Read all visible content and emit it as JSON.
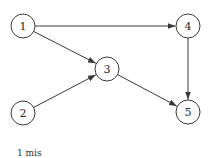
{
  "diagram": {
    "type": "directed-graph",
    "colors": {
      "stroke": "#3a3a3a",
      "text": "#2a2a2a",
      "background": "#ffffff"
    },
    "nodes": [
      {
        "id": "1",
        "label": "1",
        "x": 23,
        "y": 26
      },
      {
        "id": "2",
        "label": "2",
        "x": 23,
        "y": 113
      },
      {
        "id": "3",
        "label": "3",
        "x": 107,
        "y": 69
      },
      {
        "id": "4",
        "label": "4",
        "x": 188,
        "y": 26
      },
      {
        "id": "5",
        "label": "5",
        "x": 188,
        "y": 112
      }
    ],
    "edges": [
      {
        "from": "1",
        "to": "4"
      },
      {
        "from": "1",
        "to": "3"
      },
      {
        "from": "2",
        "to": "3"
      },
      {
        "from": "3",
        "to": "5"
      },
      {
        "from": "4",
        "to": "5"
      }
    ],
    "node_radius": 12
  },
  "caption": "1 mis"
}
